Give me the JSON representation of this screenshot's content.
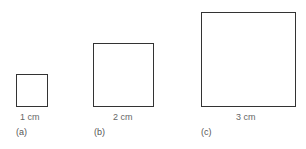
{
  "figure": {
    "panels": [
      {
        "id": "a",
        "size_label": "1 cm",
        "caption": "(a)"
      },
      {
        "id": "b",
        "size_label": "2 cm",
        "caption": "(b)"
      },
      {
        "id": "c",
        "size_label": "3 cm",
        "caption": "(c)"
      }
    ]
  }
}
